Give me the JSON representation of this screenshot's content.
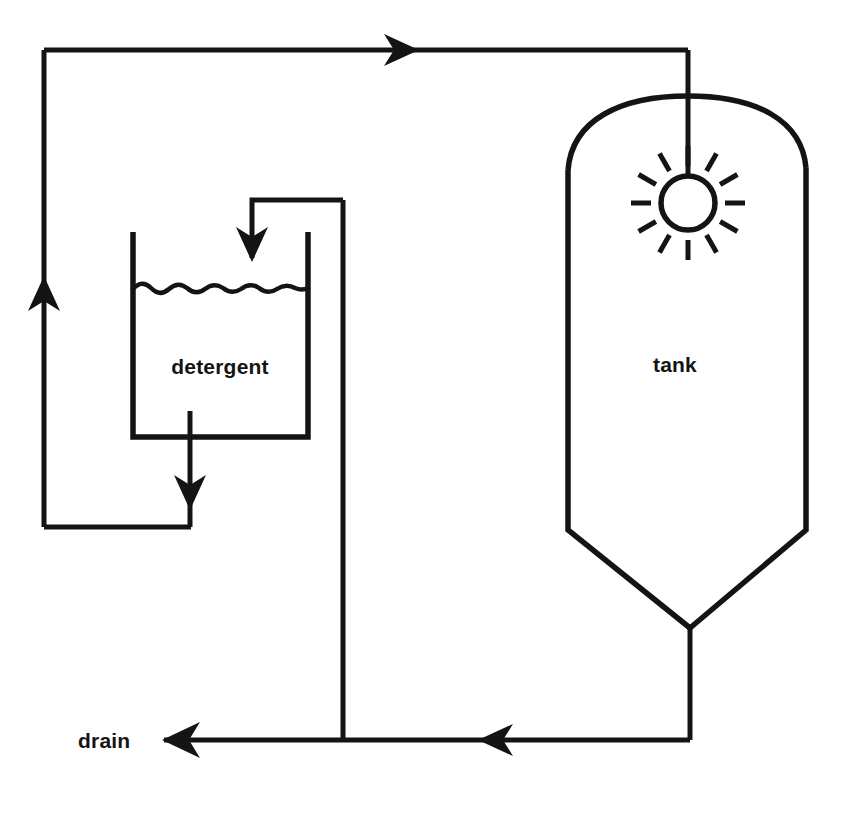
{
  "diagram": {
    "type": "process-flow-diagram",
    "background_color": "#ffffff",
    "line_color": "#141414",
    "canvas": {
      "width": 841,
      "height": 818
    },
    "labels": {
      "tank": "tank",
      "detergent": "detergent",
      "drain": "drain"
    },
    "nodes": [
      {
        "id": "tank",
        "label": "tank",
        "shape": "vertical-vessel-domed-top-conical-bottom",
        "label_x": 675,
        "label_y": 372,
        "top_dome_apex_y": 96,
        "body_left_x": 568,
        "body_right_x": 806,
        "body_top_y": 168,
        "cone_start_y": 530,
        "cone_apex_x": 690,
        "cone_apex_y": 628
      },
      {
        "id": "detergent",
        "label": "detergent",
        "shape": "open-top-rectangular-tank-with-liquid",
        "label_x": 220,
        "label_y": 374,
        "left_x": 133,
        "right_x": 308,
        "top_y": 232,
        "bottom_y": 437,
        "liquid_level_y": 289
      },
      {
        "id": "spray-nozzle",
        "label": "",
        "shape": "radial-burst-spray-nozzle",
        "center_x": 688,
        "center_y": 203,
        "radius": 27,
        "ray_count": 12
      },
      {
        "id": "drain",
        "label": "drain",
        "shape": "terminal-label",
        "label_x": 78,
        "label_y": 747
      }
    ],
    "flow_arrows": [
      {
        "id": "top-feed-arrow",
        "direction": "right",
        "x": 410,
        "y": 50
      },
      {
        "id": "detergent-inlet-arrow",
        "direction": "down",
        "x": 252,
        "y": 255
      },
      {
        "id": "detergent-outlet-arrow",
        "direction": "down",
        "x": 190,
        "y": 500
      },
      {
        "id": "return-riser-arrow",
        "direction": "up",
        "x": 44,
        "y": 290
      },
      {
        "id": "drain-mid-arrow",
        "direction": "left",
        "x": 490,
        "y": 740
      },
      {
        "id": "drain-terminal-arrow",
        "direction": "left",
        "x": 167,
        "y": 740
      }
    ],
    "pipe_segments": [
      {
        "id": "return-to-top-header",
        "from": "detergent-outlet",
        "to": "tank-spray-nozzle",
        "path": "left-riser-then-top-header"
      },
      {
        "id": "tank-downcomer",
        "from": "top-header",
        "to": "spray-nozzle",
        "path": "vertical"
      },
      {
        "id": "supply-riser",
        "from": "drain-header",
        "to": "detergent-inlet",
        "path": "vertical-then-left"
      },
      {
        "id": "detergent-drop-leg",
        "from": "detergent-tank-bottom",
        "to": "return-riser",
        "path": "down-then-left"
      },
      {
        "id": "tank-bottom-outlet",
        "from": "tank-cone-apex",
        "to": "drain-header",
        "path": "down-then-left"
      },
      {
        "id": "drain-header",
        "from": "tank-bottom-outlet",
        "to": "drain",
        "path": "horizontal-left"
      }
    ]
  }
}
